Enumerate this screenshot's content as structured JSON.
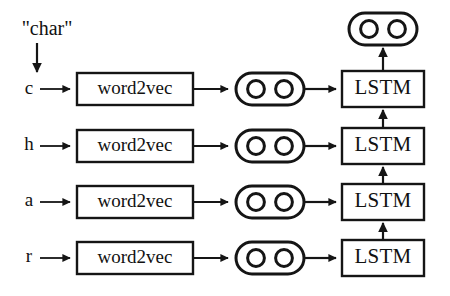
{
  "diagram": {
    "source_label": "\"char\"",
    "colors": {
      "background": "#ffffff",
      "stroke": "#151515",
      "fill": "#ffffff"
    },
    "column_labels": {
      "embedding": "word2vec",
      "recurrent": "LSTM"
    },
    "vector_node": {
      "name": "embedding-vector",
      "units": 2
    },
    "output_node": {
      "name": "output-vector",
      "units": 2
    },
    "rows": [
      {
        "index": 0,
        "char": "c",
        "embedding_label": "word2vec",
        "vector_units": 2,
        "recurrent_label": "LSTM"
      },
      {
        "index": 1,
        "char": "h",
        "embedding_label": "word2vec",
        "vector_units": 2,
        "recurrent_label": "LSTM"
      },
      {
        "index": 2,
        "char": "a",
        "embedding_label": "word2vec",
        "vector_units": 2,
        "recurrent_label": "LSTM"
      },
      {
        "index": 3,
        "char": "r",
        "embedding_label": "word2vec",
        "vector_units": 2,
        "recurrent_label": "LSTM"
      }
    ]
  }
}
